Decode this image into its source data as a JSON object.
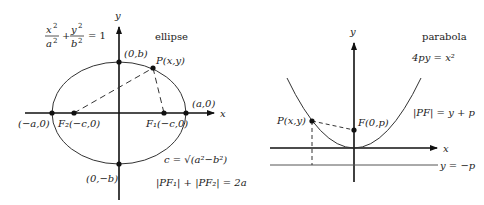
{
  "ellipse": {
    "title": "ellipse",
    "equation": {
      "x_num": "x",
      "x_den": "a",
      "plus": "+",
      "y_num": "y",
      "y_den": "b",
      "sq": "2",
      "rhs": "= 1"
    },
    "axis_x": "x",
    "axis_y": "y",
    "points": {
      "top": "(0,b)",
      "bottom": "(0,−b)",
      "left": "(−a,0)",
      "right": "(a,0)",
      "f2": "F₂(−c,0)",
      "f1": "F₁(−c,0)",
      "p": "P(x,y)"
    },
    "c_relation": "c = √(a²−b²)",
    "focal_sum": "|PF₁| + |PF₂| = 2a"
  },
  "parabola": {
    "title": "parabola",
    "equation": "4py = x²",
    "axis_x": "x",
    "axis_y": "y",
    "points": {
      "focus": "F(0,p)",
      "p": "P(x,y)"
    },
    "focal_relation": "|PF| = y + p",
    "directrix": "y = −p"
  }
}
